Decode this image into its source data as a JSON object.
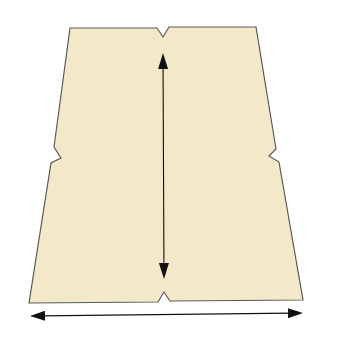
{
  "diagram": {
    "title": "Skirt pattern piece",
    "colors": {
      "fabric_fill": "#f3e9c9",
      "outline": "#5a5a5a",
      "arrow": "#111111",
      "background": "#ffffff"
    },
    "pattern_piece": {
      "shape": "trapezoid panel with notches",
      "outline_points": [
        [
          70,
          28
        ],
        [
          157,
          28
        ],
        [
          163,
          37
        ],
        [
          169,
          27
        ],
        [
          256,
          27
        ],
        [
          276,
          149
        ],
        [
          269,
          156
        ],
        [
          279,
          162
        ],
        [
          303,
          300
        ],
        [
          170,
          301
        ],
        [
          164,
          292
        ],
        [
          158,
          302
        ],
        [
          29,
          303
        ],
        [
          51,
          163
        ],
        [
          61,
          158
        ],
        [
          54,
          147
        ]
      ],
      "notches": [
        {
          "position": "top-center",
          "apex": [
            163,
            37
          ]
        },
        {
          "position": "left-side",
          "apex": [
            61,
            158
          ]
        },
        {
          "position": "right-side",
          "apex": [
            269,
            156
          ]
        },
        {
          "position": "bottom-center",
          "apex": [
            164,
            292
          ]
        }
      ]
    },
    "grainline_arrow": {
      "orientation": "vertical",
      "start": [
        163,
        53
      ],
      "end": [
        164,
        279
      ],
      "heads": "both"
    },
    "width_arrow": {
      "orientation": "horizontal",
      "start": [
        30,
        316
      ],
      "end": [
        303,
        313
      ],
      "heads": "both"
    }
  }
}
